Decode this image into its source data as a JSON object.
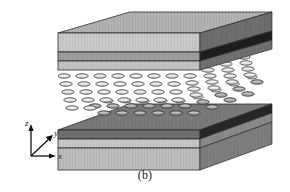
{
  "figure": {
    "caption": "(b)",
    "background_color": "#ffffff",
    "axes": {
      "origin_label": "",
      "items": [
        {
          "id": "z",
          "label": "z",
          "direction": "up"
        },
        {
          "id": "y",
          "label": "y",
          "direction": "up-right-diagonal"
        },
        {
          "id": "x",
          "label": "x",
          "direction": "right"
        }
      ],
      "arrow_color": "#111111"
    },
    "colors": {
      "slab_top_face": "#b4b4b4",
      "slab_light_layer": "#c9c9c9",
      "slab_mid_layer": "#a0a0a0",
      "slab_dark_layer": "#7a7a7a",
      "slab_side_face": "#6e6e6e",
      "slab_side_dark_band": "#3a3a3a",
      "slab_side_black_band": "#1c1c1c",
      "bottom_surface_dark": "#767676",
      "molecule_light": "#d8d8d8",
      "molecule_stroke": "#4a4a4a",
      "molecule_dark": "#8a8a8a",
      "outline": "#2b2b2b",
      "gap_white": "#ffffff"
    },
    "upper_slab": {
      "name": "upper substrate",
      "layers": [
        "light",
        "mid",
        "light"
      ]
    },
    "lower_slab": {
      "name": "lower substrate",
      "layers": [
        "dark-surface",
        "light",
        "light"
      ]
    },
    "molecule_layer": {
      "name": "liquid crystal molecules",
      "rows": 5,
      "columns": 8,
      "shape": "ellipse",
      "orientation": "planar-horizontal"
    }
  }
}
